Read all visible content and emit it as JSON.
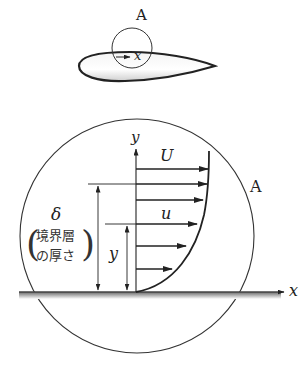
{
  "figure": {
    "airfoil_view": {
      "region_label": "A",
      "axis_label": "x"
    },
    "detail_view": {
      "region_label": "A",
      "x_axis_label": "x",
      "y_axis_label": "y",
      "freestream_velocity_label": "U",
      "local_velocity_label": "u",
      "height_label": "y",
      "thickness_symbol": "δ",
      "thickness_note_line1": "境界層",
      "thickness_note_line2": "の厚さ",
      "paren_open": "(",
      "paren_close": ")"
    },
    "velocity_profile_arrows": [
      {
        "y": 169,
        "x_end": 208
      },
      {
        "y": 184,
        "x_end": 207
      },
      {
        "y": 200,
        "x_end": 203
      },
      {
        "y": 224,
        "x_end": 197
      },
      {
        "y": 246,
        "x_end": 186
      },
      {
        "y": 269,
        "x_end": 172
      }
    ],
    "colors": {
      "stroke": "#222222",
      "ground": "#555555",
      "airfoil_fill": "#e6e6e6"
    }
  }
}
